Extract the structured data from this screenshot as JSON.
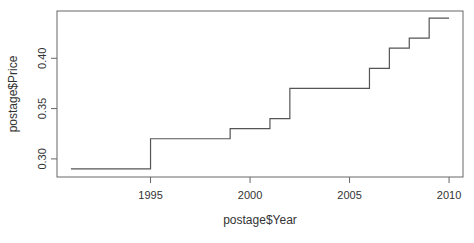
{
  "chart_data": {
    "type": "line",
    "subtype": "step",
    "title": "",
    "xlabel": "postage$Year",
    "ylabel": "postage$Price",
    "xlim": [
      1990.3,
      2010.7
    ],
    "ylim": [
      0.282,
      0.447
    ],
    "x_ticks": [
      1995,
      2000,
      2005,
      2010
    ],
    "x_tick_labels": [
      "1995",
      "2000",
      "2005",
      "2010"
    ],
    "y_ticks": [
      0.3,
      0.35,
      0.4
    ],
    "y_tick_labels": [
      "0.30",
      "0.35",
      "0.40"
    ],
    "grid": false,
    "legend": null,
    "series": [
      {
        "name": "postage price",
        "x": [
          1991,
          1995,
          1999,
          2001,
          2002,
          2006,
          2007,
          2008,
          2009,
          2010
        ],
        "values": [
          0.29,
          0.32,
          0.33,
          0.34,
          0.37,
          0.39,
          0.41,
          0.42,
          0.44,
          0.44
        ],
        "color": "#555555"
      }
    ]
  }
}
